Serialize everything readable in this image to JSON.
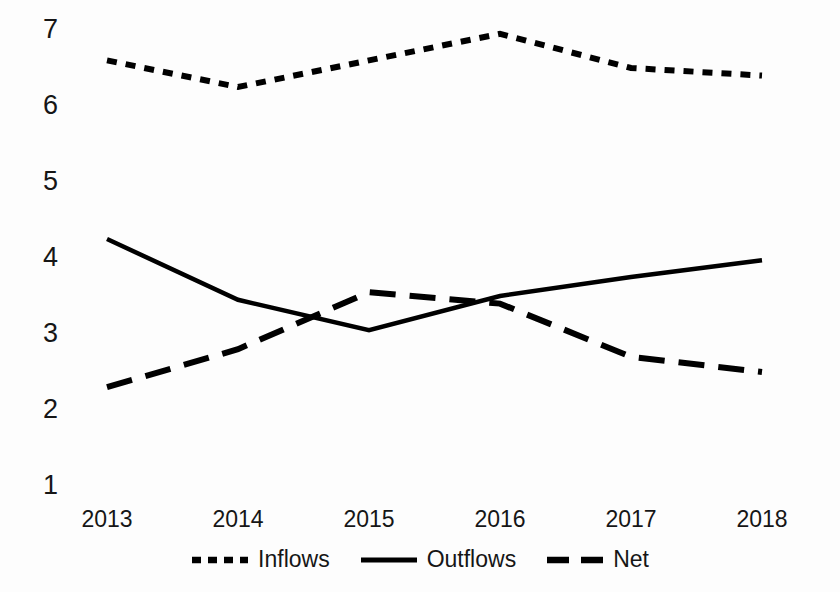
{
  "chart_data": {
    "type": "line",
    "title": "",
    "subtitle": "",
    "xlabel": "",
    "ylabel": "",
    "categories": [
      "2013",
      "2014",
      "2015",
      "2016",
      "2017",
      "2018"
    ],
    "x_tick_labels": [
      "2013",
      "2014",
      "2015",
      "2016",
      "2017",
      "2018"
    ],
    "y_tick_labels": [
      "7",
      "6",
      "5",
      "4",
      "3",
      "2",
      "1"
    ],
    "ylim": [
      1,
      7
    ],
    "xlim": [
      2013,
      2018
    ],
    "grid": false,
    "legend_position": "bottom",
    "series": [
      {
        "name": "Inflows",
        "style": "dotted",
        "color": "#000000",
        "values": [
          6.6,
          6.25,
          6.6,
          6.95,
          6.5,
          6.4
        ]
      },
      {
        "name": "Outflows",
        "style": "solid",
        "color": "#000000",
        "values": [
          4.25,
          3.45,
          3.05,
          3.5,
          3.75,
          3.97
        ]
      },
      {
        "name": "Net",
        "style": "dashed",
        "color": "#000000",
        "values": [
          2.3,
          2.8,
          3.55,
          3.4,
          2.7,
          2.5
        ]
      }
    ]
  },
  "axes": {
    "y_ticks": [
      {
        "label": "7",
        "value": 7
      },
      {
        "label": "6",
        "value": 6
      },
      {
        "label": "5",
        "value": 5
      },
      {
        "label": "4",
        "value": 4
      },
      {
        "label": "3",
        "value": 3
      },
      {
        "label": "2",
        "value": 2
      },
      {
        "label": "1",
        "value": 1
      }
    ],
    "x_ticks": [
      {
        "label": "2013"
      },
      {
        "label": "2014"
      },
      {
        "label": "2015"
      },
      {
        "label": "2016"
      },
      {
        "label": "2017"
      },
      {
        "label": "2018"
      }
    ]
  },
  "legend": {
    "items": [
      {
        "label": "Inflows",
        "style": "dotted"
      },
      {
        "label": "Outflows",
        "style": "solid"
      },
      {
        "label": "Net",
        "style": "dashed"
      }
    ]
  },
  "colors": {
    "line": "#000000",
    "text": "#161616",
    "background": "#fdfdfd"
  }
}
